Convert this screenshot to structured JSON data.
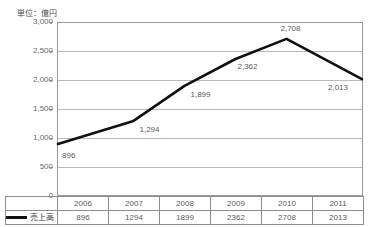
{
  "chart_data": {
    "type": "line",
    "title": "",
    "unit_label": "単位：億円",
    "categories": [
      "2006",
      "2007",
      "2008",
      "2009",
      "2010",
      "2011"
    ],
    "series": [
      {
        "name": "売上高",
        "values": [
          896,
          1294,
          1899,
          2362,
          2708,
          2013
        ],
        "value_labels": [
          "896",
          "1,294",
          "1,899",
          "2,362",
          "2,708",
          "2,013"
        ],
        "color": "#111111"
      }
    ],
    "xlabel": "",
    "ylabel": "",
    "ylim": [
      0,
      3000
    ],
    "ytick_values": [
      0,
      500,
      1000,
      1500,
      2000,
      2500,
      3000
    ],
    "ytick_labels": [
      "0",
      "500",
      "1,000",
      "1,500",
      "2,000",
      "2,500",
      "3,000"
    ],
    "grid": true,
    "legend_position": "bottom-left-table"
  },
  "table": {
    "header_row": [
      "2006",
      "2007",
      "2008",
      "2009",
      "2010",
      "2011"
    ],
    "value_row": [
      "896",
      "1294",
      "1899",
      "2362",
      "2708",
      "2013"
    ],
    "legend_label": "売上高"
  },
  "colors": {
    "line": "#111111",
    "grid": "#b9b9b9",
    "axis": "#8e8e8e",
    "text": "#5b5b5b",
    "background": "#ffffff"
  }
}
